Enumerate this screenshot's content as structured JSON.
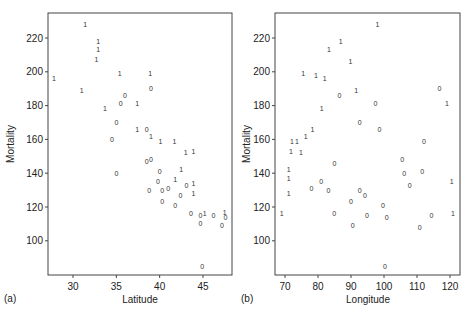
{
  "chart_data": [
    {
      "type": "scatter",
      "panel_label": "(a)",
      "title": "",
      "xlabel": "Latitude",
      "ylabel": "Mortality",
      "xlim": [
        27,
        48.5
      ],
      "ylim": [
        80,
        235
      ],
      "xticks": [
        30,
        35,
        40,
        45
      ],
      "yticks": [
        100,
        120,
        140,
        160,
        180,
        200,
        220
      ],
      "grid": false,
      "marker": "text glyph ('0' or '1' indicating group)",
      "points": [
        {
          "x": 27.8,
          "y": 196,
          "label": "1"
        },
        {
          "x": 31.4,
          "y": 228,
          "label": "1"
        },
        {
          "x": 32.9,
          "y": 218,
          "label": "1"
        },
        {
          "x": 32.9,
          "y": 213,
          "label": "1"
        },
        {
          "x": 32.7,
          "y": 207,
          "label": "1"
        },
        {
          "x": 35.4,
          "y": 199,
          "label": "1"
        },
        {
          "x": 38.9,
          "y": 199,
          "label": "1"
        },
        {
          "x": 39.0,
          "y": 190,
          "label": "0"
        },
        {
          "x": 31.0,
          "y": 189,
          "label": "1"
        },
        {
          "x": 36.0,
          "y": 186,
          "label": "0"
        },
        {
          "x": 35.5,
          "y": 181,
          "label": "0"
        },
        {
          "x": 37.4,
          "y": 181,
          "label": "1"
        },
        {
          "x": 33.7,
          "y": 178,
          "label": "1"
        },
        {
          "x": 35.0,
          "y": 170,
          "label": "0"
        },
        {
          "x": 37.4,
          "y": 166,
          "label": "1"
        },
        {
          "x": 38.5,
          "y": 166,
          "label": "0"
        },
        {
          "x": 39.0,
          "y": 162,
          "label": "1"
        },
        {
          "x": 34.5,
          "y": 160,
          "label": "0"
        },
        {
          "x": 40.1,
          "y": 159,
          "label": "1"
        },
        {
          "x": 41.7,
          "y": 159,
          "label": "1"
        },
        {
          "x": 43.0,
          "y": 152,
          "label": "1"
        },
        {
          "x": 43.9,
          "y": 153,
          "label": "1"
        },
        {
          "x": 38.5,
          "y": 147,
          "label": "0"
        },
        {
          "x": 39.0,
          "y": 148,
          "label": "0"
        },
        {
          "x": 35.0,
          "y": 140,
          "label": "0"
        },
        {
          "x": 40.0,
          "y": 141,
          "label": "0"
        },
        {
          "x": 42.5,
          "y": 142,
          "label": "1"
        },
        {
          "x": 39.8,
          "y": 135,
          "label": "0"
        },
        {
          "x": 41.8,
          "y": 136,
          "label": "1"
        },
        {
          "x": 43.1,
          "y": 133,
          "label": "0"
        },
        {
          "x": 43.9,
          "y": 134,
          "label": "1"
        },
        {
          "x": 38.8,
          "y": 130,
          "label": "0"
        },
        {
          "x": 40.3,
          "y": 130,
          "label": "0"
        },
        {
          "x": 41.0,
          "y": 131,
          "label": "0"
        },
        {
          "x": 42.4,
          "y": 127,
          "label": "0"
        },
        {
          "x": 43.9,
          "y": 128,
          "label": "1"
        },
        {
          "x": 40.3,
          "y": 123,
          "label": "0"
        },
        {
          "x": 41.8,
          "y": 121,
          "label": "0"
        },
        {
          "x": 43.6,
          "y": 116,
          "label": "0"
        },
        {
          "x": 44.7,
          "y": 115,
          "label": "0"
        },
        {
          "x": 45.2,
          "y": 116,
          "label": "1"
        },
        {
          "x": 46.2,
          "y": 115,
          "label": "0"
        },
        {
          "x": 47.5,
          "y": 117,
          "label": "1"
        },
        {
          "x": 47.6,
          "y": 114,
          "label": "0"
        },
        {
          "x": 44.7,
          "y": 110,
          "label": "0"
        },
        {
          "x": 47.2,
          "y": 109,
          "label": "0"
        },
        {
          "x": 44.9,
          "y": 85,
          "label": "0"
        }
      ]
    },
    {
      "type": "scatter",
      "panel_label": "(b)",
      "title": "",
      "xlabel": "Longitude",
      "ylabel": "Mortality",
      "xlim": [
        67,
        123
      ],
      "ylim": [
        80,
        235
      ],
      "xticks": [
        70,
        80,
        90,
        100,
        110,
        120
      ],
      "yticks": [
        100,
        120,
        140,
        160,
        180,
        200,
        220
      ],
      "grid": false,
      "marker": "text glyph ('0' or '1' indicating group)",
      "points": [
        {
          "x": 98.0,
          "y": 228,
          "label": "1"
        },
        {
          "x": 86.9,
          "y": 218,
          "label": "1"
        },
        {
          "x": 83.3,
          "y": 213,
          "label": "1"
        },
        {
          "x": 89.8,
          "y": 206,
          "label": "1"
        },
        {
          "x": 75.5,
          "y": 199,
          "label": "1"
        },
        {
          "x": 79.4,
          "y": 198,
          "label": "1"
        },
        {
          "x": 82.0,
          "y": 196,
          "label": "1"
        },
        {
          "x": 116.8,
          "y": 190,
          "label": "0"
        },
        {
          "x": 91.6,
          "y": 189,
          "label": "1"
        },
        {
          "x": 86.5,
          "y": 186,
          "label": "0"
        },
        {
          "x": 97.4,
          "y": 181,
          "label": "0"
        },
        {
          "x": 119.1,
          "y": 181,
          "label": "1"
        },
        {
          "x": 81.1,
          "y": 178,
          "label": "1"
        },
        {
          "x": 92.6,
          "y": 170,
          "label": "0"
        },
        {
          "x": 78.3,
          "y": 166,
          "label": "1"
        },
        {
          "x": 98.6,
          "y": 166,
          "label": "0"
        },
        {
          "x": 76.3,
          "y": 162,
          "label": "1"
        },
        {
          "x": 72.1,
          "y": 159,
          "label": "1"
        },
        {
          "x": 73.6,
          "y": 159,
          "label": "1"
        },
        {
          "x": 112.1,
          "y": 159,
          "label": "0"
        },
        {
          "x": 71.8,
          "y": 153,
          "label": "1"
        },
        {
          "x": 74.8,
          "y": 152,
          "label": "1"
        },
        {
          "x": 105.5,
          "y": 148,
          "label": "0"
        },
        {
          "x": 85.0,
          "y": 146,
          "label": "0"
        },
        {
          "x": 71.1,
          "y": 142,
          "label": "1"
        },
        {
          "x": 106.1,
          "y": 140,
          "label": "0"
        },
        {
          "x": 111.6,
          "y": 141,
          "label": "0"
        },
        {
          "x": 71.1,
          "y": 137,
          "label": "1"
        },
        {
          "x": 81.0,
          "y": 135,
          "label": "0"
        },
        {
          "x": 120.5,
          "y": 135,
          "label": "1"
        },
        {
          "x": 107.8,
          "y": 133,
          "label": "0"
        },
        {
          "x": 78.0,
          "y": 131,
          "label": "0"
        },
        {
          "x": 83.2,
          "y": 130,
          "label": "0"
        },
        {
          "x": 92.6,
          "y": 130,
          "label": "0"
        },
        {
          "x": 71.1,
          "y": 128,
          "label": "1"
        },
        {
          "x": 94.2,
          "y": 127,
          "label": "0"
        },
        {
          "x": 90.0,
          "y": 123,
          "label": "0"
        },
        {
          "x": 99.7,
          "y": 121,
          "label": "0"
        },
        {
          "x": 69.0,
          "y": 116,
          "label": "1"
        },
        {
          "x": 84.9,
          "y": 116,
          "label": "0"
        },
        {
          "x": 120.9,
          "y": 116,
          "label": "1"
        },
        {
          "x": 94.8,
          "y": 115,
          "label": "0"
        },
        {
          "x": 114.4,
          "y": 115,
          "label": "0"
        },
        {
          "x": 100.8,
          "y": 114,
          "label": "0"
        },
        {
          "x": 90.5,
          "y": 109,
          "label": "0"
        },
        {
          "x": 110.8,
          "y": 108,
          "label": "0"
        },
        {
          "x": 100.3,
          "y": 85,
          "label": "0"
        }
      ]
    }
  ]
}
